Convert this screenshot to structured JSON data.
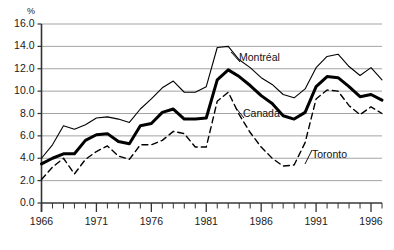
{
  "chart_data": {
    "type": "line",
    "title": "",
    "xlabel": "",
    "ylabel": "%",
    "y_unit_label": "%",
    "xlim": [
      1966,
      1997
    ],
    "ylim": [
      0.0,
      16.0
    ],
    "y_ticks": [
      "0.0",
      "2.0",
      "4.0",
      "6.0",
      "8.0",
      "10.0",
      "12.0",
      "14.0",
      "16.0"
    ],
    "y_tick_values": [
      0,
      2,
      4,
      6,
      8,
      10,
      12,
      14,
      16
    ],
    "x_ticks_major": [
      1966,
      1971,
      1976,
      1981,
      1986,
      1991,
      1996
    ],
    "x_tick_labels": [
      "1966",
      "1971",
      "1976",
      "1981",
      "1986",
      "1991",
      "1996"
    ],
    "x_tick_step_minor": 1,
    "grid": "horizontal",
    "legend_position": "inline-annotations",
    "x": [
      1966,
      1967,
      1968,
      1969,
      1970,
      1971,
      1972,
      1973,
      1974,
      1975,
      1976,
      1977,
      1978,
      1979,
      1980,
      1981,
      1982,
      1983,
      1984,
      1985,
      1986,
      1987,
      1988,
      1989,
      1990,
      1991,
      1992,
      1993,
      1994,
      1995,
      1996,
      1997
    ],
    "series": [
      {
        "name": "Montréal",
        "style": "thin-solid",
        "color": "#000000",
        "width": 1.1,
        "values": [
          4.0,
          5.2,
          6.9,
          6.6,
          7.0,
          7.6,
          7.7,
          7.5,
          7.2,
          8.4,
          9.3,
          10.3,
          10.9,
          9.9,
          9.9,
          10.4,
          13.9,
          14.0,
          12.8,
          12.1,
          11.2,
          10.6,
          9.7,
          9.4,
          10.2,
          12.1,
          13.1,
          13.3,
          12.2,
          11.4,
          12.1,
          11.0
        ]
      },
      {
        "name": "Canada",
        "style": "thick-solid",
        "color": "#000000",
        "width": 3.0,
        "values": [
          3.5,
          4.0,
          4.4,
          4.4,
          5.6,
          6.1,
          6.2,
          5.5,
          5.3,
          6.9,
          7.1,
          8.1,
          8.4,
          7.5,
          7.5,
          7.6,
          11.0,
          11.9,
          11.3,
          10.5,
          9.6,
          8.9,
          7.8,
          7.5,
          8.1,
          10.4,
          11.3,
          11.2,
          10.4,
          9.5,
          9.7,
          9.2
        ]
      },
      {
        "name": "Toronto",
        "style": "dashed",
        "color": "#000000",
        "width": 1.4,
        "values": [
          2.1,
          3.2,
          4.0,
          2.6,
          3.9,
          4.6,
          5.1,
          4.2,
          3.9,
          5.2,
          5.2,
          5.6,
          6.4,
          6.2,
          5.0,
          5.0,
          9.1,
          9.9,
          7.9,
          6.3,
          5.0,
          4.0,
          3.3,
          3.4,
          5.4,
          9.3,
          10.1,
          10.0,
          8.7,
          7.9,
          8.6,
          8.0
        ]
      }
    ],
    "annotations": [
      {
        "text": "Montréal",
        "series": "Montréal"
      },
      {
        "text": "Canada",
        "series": "Canada"
      },
      {
        "text": "Toronto",
        "series": "Toronto"
      }
    ]
  }
}
